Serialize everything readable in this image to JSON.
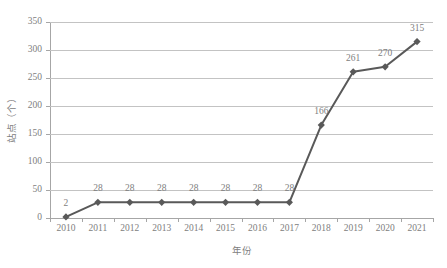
{
  "chart_data": {
    "type": "line",
    "title": "",
    "xlabel": "年份",
    "ylabel": "站点（个）",
    "categories": [
      "2010",
      "2011",
      "2012",
      "2013",
      "2014",
      "2015",
      "2016",
      "2017",
      "2018",
      "2019",
      "2020",
      "2021"
    ],
    "values": [
      2,
      28,
      28,
      28,
      28,
      28,
      28,
      28,
      166,
      261,
      270,
      315
    ],
    "data_labels": [
      "2",
      "28",
      "28",
      "28",
      "28",
      "28",
      "28",
      "28",
      "166",
      "261",
      "270",
      "315"
    ],
    "ylim": [
      0,
      350
    ],
    "yticks": [
      0,
      50,
      100,
      150,
      200,
      250,
      300,
      350
    ],
    "ytick_labels": [
      "0",
      "50",
      "100",
      "150",
      "200",
      "250",
      "300",
      "350"
    ],
    "grid": true,
    "legend": "none",
    "series": [
      {
        "name": "站点（个）",
        "values": [
          2,
          28,
          28,
          28,
          28,
          28,
          28,
          28,
          166,
          261,
          270,
          315
        ],
        "marker": "diamond",
        "color": "#595959"
      }
    ],
    "colors": {
      "series_line": "#595959",
      "marker": "#595959",
      "gridline": "#c3c3c3",
      "axis": "#a6a6a6",
      "tick_text": "#808080",
      "data_label_text": "#808080",
      "background": "#ffffff"
    }
  }
}
